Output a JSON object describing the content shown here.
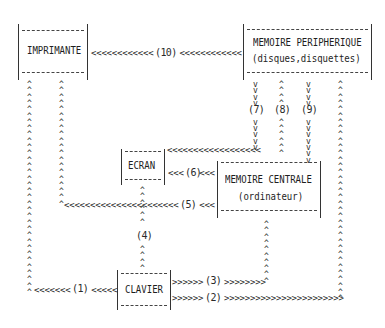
{
  "nodes": {
    "imprimante": {
      "label": "IMPRIMANTE"
    },
    "peripherique": {
      "label": "MEMOIRE PERIPHERIQUE",
      "sublabel": "(disques,disquettes)"
    },
    "ecran": {
      "label": "ECRAN"
    },
    "centrale": {
      "label": "MEMOIRE CENTRALE",
      "sublabel": "(ordinateur)"
    },
    "clavier": {
      "label": "CLAVIER"
    }
  },
  "flows": {
    "f10": {
      "label": "(10)",
      "from": "MEMOIRE PERIPHERIQUE",
      "to": "IMPRIMANTE"
    },
    "f7": {
      "label": "(7)",
      "from": "MEMOIRE PERIPHERIQUE",
      "to": "ECRAN"
    },
    "f8": {
      "label": "(8)",
      "from": "MEMOIRE CENTRALE",
      "to": "MEMOIRE PERIPHERIQUE"
    },
    "f9": {
      "label": "(9)",
      "from": "MEMOIRE PERIPHERIQUE",
      "to": "MEMOIRE CENTRALE"
    },
    "f6": {
      "label": "(6)",
      "from": "MEMOIRE CENTRALE",
      "to": "ECRAN"
    },
    "f5": {
      "label": "(5)",
      "from": "MEMOIRE CENTRALE",
      "to": "IMPRIMANTE"
    },
    "f4": {
      "label": "(4)",
      "from": "CLAVIER",
      "to": "ECRAN"
    },
    "f1": {
      "label": "(1)",
      "from": "CLAVIER",
      "to": "IMPRIMANTE"
    },
    "f3": {
      "label": "(3)",
      "from": "CLAVIER",
      "to": "MEMOIRE CENTRALE"
    },
    "f2": {
      "label": "(2)",
      "from": "CLAVIER",
      "to": "MEMOIRE PERIPHERIQUE"
    }
  },
  "glyphs": {
    "left": "<",
    "right": ">",
    "up": "^",
    "down": "v"
  }
}
